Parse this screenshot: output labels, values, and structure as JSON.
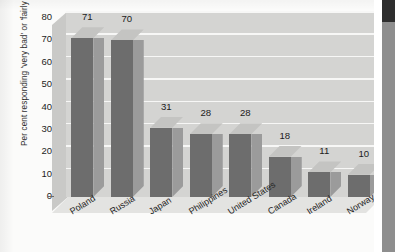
{
  "chart_data": {
    "type": "bar",
    "title": "",
    "subtitle": "",
    "xlabel": "",
    "ylabel": "Per cent responding 'very bad' or 'fairly bad'",
    "categories": [
      "Poland",
      "Russia",
      "Japan",
      "Philippines",
      "United States",
      "Canada",
      "Ireland",
      "Norway"
    ],
    "values": [
      71,
      70,
      31,
      28,
      28,
      18,
      11,
      10
    ],
    "data_labels": [
      "71",
      "70",
      "31",
      "28",
      "28",
      "18",
      "11",
      "10"
    ],
    "ylim": [
      0,
      80
    ],
    "ytick_labels": [
      "80",
      "70",
      "60",
      "50",
      "40",
      "30",
      "20",
      "10",
      "0"
    ],
    "ytick_values": [
      80,
      70,
      60,
      50,
      40,
      30,
      20,
      10,
      0
    ],
    "grid": true,
    "grid_axis": "y",
    "legend": false,
    "legend_position": "none",
    "style": "3d-bar",
    "colors": {
      "bar_front": "#6d6d6d",
      "bar_side": "#9b9b9b",
      "bar_top": "#c4c4c2",
      "plot_background": "#d4d4d2",
      "gridline": "#f7f7f6",
      "floor": "#e3e3e1",
      "text": "#1c1c1c",
      "page_background": "#fbfbfa"
    }
  },
  "scan_strip": {
    "dark_band": "#2e2e2e",
    "grey_band": "#8e8e8e"
  }
}
